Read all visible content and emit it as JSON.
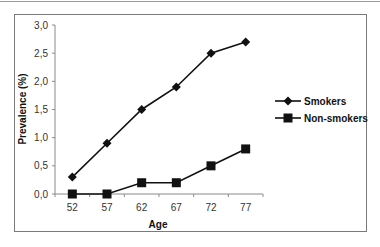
{
  "chart_data": {
    "type": "line",
    "title": "",
    "xlabel": "Age",
    "ylabel": "Prevalence (%)",
    "categories": [
      "52",
      "57",
      "62",
      "67",
      "72",
      "77"
    ],
    "series": [
      {
        "name": "Smokers",
        "marker": "diamond",
        "values": [
          0.3,
          0.9,
          1.5,
          1.9,
          2.5,
          2.7
        ]
      },
      {
        "name": "Non-smokers",
        "marker": "square",
        "values": [
          0.0,
          0.0,
          0.2,
          0.2,
          0.5,
          0.8
        ]
      }
    ],
    "ylim": [
      0,
      3.0
    ],
    "yticks": [
      "0,0",
      "0,5",
      "1,0",
      "1,5",
      "2,0",
      "2,5",
      "3,0"
    ],
    "grid": false,
    "legend_position": "right",
    "line_color": "#111111"
  }
}
